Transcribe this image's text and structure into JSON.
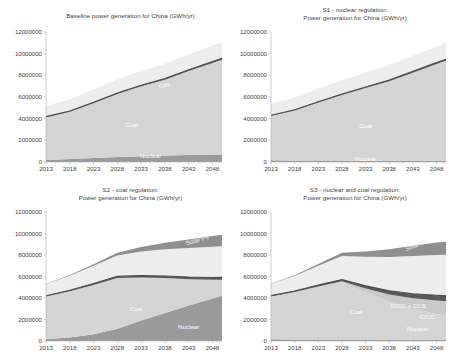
{
  "figure": {
    "background_color": "#ffffff",
    "panel_count": 4
  },
  "axis": {
    "y_ticks": [
      "12000000",
      "10000000",
      "8000000",
      "6000000",
      "4000000",
      "2000000",
      "0"
    ],
    "y_values": [
      12000000,
      10000000,
      8000000,
      6000000,
      4000000,
      2000000,
      0
    ],
    "x_ticks": [
      "2013",
      "2018",
      "2023",
      "2028",
      "2033",
      "2038",
      "2043",
      "2048"
    ],
    "x_values": [
      2013,
      2018,
      2023,
      2028,
      2033,
      2038,
      2043,
      2048
    ],
    "ylim": [
      0,
      12000000
    ],
    "xlim": [
      2013,
      2050
    ],
    "units": "GWh/yr"
  },
  "colors": {
    "nuclear": "#9a9a9a",
    "coal": "#d4d4d4",
    "igcc": "#c9c9c9",
    "igcc_ccs": "#5a5a5a",
    "gas": "#ededed",
    "hydro": "#f2f2f2",
    "solar_pv": "#8f8f8f",
    "wind": "#f7f7f7",
    "axis": "#b0b0b0",
    "text": "#3f3f3f",
    "title": "#404040"
  },
  "panels": [
    {
      "id": "baseline",
      "title": "Baseline power generation for China (GWh/yr)",
      "title_lines": [
        "Baseline power generation for China (GWh/yr)"
      ],
      "labels": [
        {
          "text": "Gas",
          "x": 2038,
          "y": 6900000,
          "rotate": -16,
          "shade": "light"
        },
        {
          "text": "Coal",
          "x": 2031,
          "y": 3200000,
          "rotate": 0,
          "shade": "light"
        },
        {
          "text": "Nuclear",
          "x": 2035,
          "y": 350000,
          "rotate": 0,
          "shade": "light"
        }
      ],
      "chart_data": {
        "type": "area",
        "title": "Baseline power generation for China (GWh/yr)",
        "xlabel": "",
        "ylabel": "GWh/yr",
        "ylim": [
          0,
          12000000
        ],
        "grid": false,
        "legend": "inline-labels",
        "x": [
          2013,
          2018,
          2023,
          2028,
          2033,
          2038,
          2043,
          2048,
          2050
        ],
        "series": [
          {
            "name": "Nuclear",
            "values": [
              180000,
              280000,
              380000,
              470000,
              540000,
              600000,
              650000,
              690000,
              700000
            ]
          },
          {
            "name": "Coal",
            "values": [
              3950000,
              4350000,
              5050000,
              5800000,
              6450000,
              7000000,
              7750000,
              8450000,
              8750000
            ]
          },
          {
            "name": "IGCC + CCS",
            "values": [
              60000,
              70000,
              80000,
              90000,
              100000,
              110000,
              120000,
              130000,
              135000
            ]
          },
          {
            "name": "Gas",
            "values": [
              1000000,
              1100000,
              1190000,
              1260000,
              1320000,
              1370000,
              1420000,
              1460000,
              1480000
            ]
          }
        ]
      }
    },
    {
      "id": "s1",
      "title": "S1 - nuclear regulation: Power generation for China (GWh/yr)",
      "title_lines": [
        "S1 - nuclear regulation:",
        "Power generation for China (GWh/yr)"
      ],
      "labels": [
        {
          "text": "Coal",
          "x": 2033,
          "y": 3100000,
          "rotate": 0,
          "shade": "light"
        },
        {
          "text": "Nuclear",
          "x": 2033,
          "y": 120000,
          "rotate": 0,
          "shade": "light"
        }
      ],
      "chart_data": {
        "type": "area",
        "title": "S1 - nuclear regulation: Power generation for China (GWh/yr)",
        "xlabel": "",
        "ylabel": "GWh/yr",
        "ylim": [
          0,
          12000000
        ],
        "grid": false,
        "legend": "inline-labels",
        "x": [
          2013,
          2018,
          2023,
          2028,
          2033,
          2038,
          2043,
          2048,
          2050
        ],
        "series": [
          {
            "name": "Nuclear",
            "values": [
              160000,
              150000,
              140000,
              130000,
              120000,
              110000,
              100000,
              95000,
              90000
            ]
          },
          {
            "name": "Coal",
            "values": [
              4100000,
              4600000,
              5350000,
              6050000,
              6700000,
              7350000,
              8150000,
              8950000,
              9250000
            ]
          },
          {
            "name": "IGCC + CCS",
            "values": [
              60000,
              70000,
              80000,
              90000,
              100000,
              110000,
              120000,
              130000,
              135000
            ]
          },
          {
            "name": "Gas",
            "values": [
              1050000,
              1130000,
              1210000,
              1280000,
              1340000,
              1390000,
              1440000,
              1480000,
              1500000
            ]
          }
        ]
      }
    },
    {
      "id": "s2",
      "title": "S2 - coal regulation: Power generation for China (GWh/yr)",
      "title_lines": [
        "S2 - coal regulation:",
        "Power generation for China (GWh/yr)"
      ],
      "labels": [
        {
          "text": "Solar PV",
          "x": 2045,
          "y": 9200000,
          "rotate": -16,
          "shade": "dark"
        },
        {
          "text": "Coal",
          "x": 2032,
          "y": 2750000,
          "rotate": 0,
          "shade": "light"
        },
        {
          "text": "Nuclear",
          "x": 2043,
          "y": 1150000,
          "rotate": 0,
          "shade": "light"
        }
      ],
      "chart_data": {
        "type": "area",
        "title": "S2 - coal regulation: Power generation for China (GWh/yr)",
        "xlabel": "",
        "ylabel": "GWh/yr",
        "ylim": [
          0,
          12000000
        ],
        "grid": false,
        "legend": "inline-labels",
        "x": [
          2013,
          2018,
          2023,
          2028,
          2033,
          2038,
          2043,
          2048,
          2050
        ],
        "series": [
          {
            "name": "Nuclear",
            "values": [
              180000,
              320000,
              620000,
              1150000,
              1900000,
              2600000,
              3300000,
              3950000,
              4200000
            ]
          },
          {
            "name": "Coal",
            "values": [
              3950000,
              4300000,
              4600000,
              4700000,
              4000000,
              3250000,
              2450000,
              1750000,
              1500000
            ]
          },
          {
            "name": "IGCC + CCS",
            "values": [
              80000,
              100000,
              130000,
              160000,
              180000,
              190000,
              200000,
              210000,
              215000
            ]
          },
          {
            "name": "Gas",
            "values": [
              1100000,
              1350000,
              1650000,
              1950000,
              2250000,
              2500000,
              2700000,
              2850000,
              2900000
            ]
          },
          {
            "name": "Solar PV",
            "values": [
              20000,
              60000,
              140000,
              260000,
              420000,
              600000,
              800000,
              1000000,
              1080000
            ]
          }
        ]
      }
    },
    {
      "id": "s3",
      "title": "S3 - nuclear and coal regulation: Power generation for China (GWh/yr)",
      "title_lines": [
        "S3 - nuclear and coal regulation:",
        "Power generation for China (GWh/yr)"
      ],
      "labels": [
        {
          "text": "Solar PV",
          "x": 2044,
          "y": 8750000,
          "rotate": -20,
          "shade": "dark"
        },
        {
          "text": "Coal",
          "x": 2031,
          "y": 2550000,
          "rotate": 0,
          "shade": "light"
        },
        {
          "text": "IGCC + CCS",
          "x": 2042,
          "y": 3100000,
          "rotate": 0,
          "shade": "light"
        },
        {
          "text": "IGCC",
          "x": 2046,
          "y": 2050000,
          "rotate": 0,
          "shade": "light"
        },
        {
          "text": "Nuclear",
          "x": 2044,
          "y": 900000,
          "rotate": 0,
          "shade": "light"
        }
      ],
      "chart_data": {
        "type": "area",
        "title": "S3 - nuclear and coal regulation: Power generation for China (GWh/yr)",
        "xlabel": "",
        "ylabel": "GWh/yr",
        "ylim": [
          0,
          12000000
        ],
        "grid": false,
        "legend": "inline-labels",
        "x": [
          2013,
          2018,
          2023,
          2028,
          2033,
          2038,
          2043,
          2048,
          2050
        ],
        "series": [
          {
            "name": "Nuclear",
            "values": [
              160000,
              150000,
              140000,
              135000,
              130000,
              125000,
              120000,
              115000,
              112000
            ]
          },
          {
            "name": "Coal",
            "values": [
              3950000,
              4350000,
              4850000,
              5300000,
              4400000,
              3500000,
              2850000,
              2400000,
              2250000
            ]
          },
          {
            "name": "IGCC",
            "values": [
              40000,
              60000,
              90000,
              130000,
              350000,
              700000,
              1000000,
              1250000,
              1330000
            ]
          },
          {
            "name": "IGCC + CCS",
            "values": [
              70000,
              90000,
              120000,
              150000,
              250000,
              350000,
              430000,
              490000,
              510000
            ]
          },
          {
            "name": "Gas",
            "values": [
              1100000,
              1400000,
              1800000,
              2200000,
              2700000,
              3150000,
              3500000,
              3750000,
              3820000
            ]
          },
          {
            "name": "Solar PV",
            "values": [
              20000,
              70000,
              160000,
              300000,
              500000,
              720000,
              950000,
              1150000,
              1220000
            ]
          }
        ]
      }
    }
  ]
}
